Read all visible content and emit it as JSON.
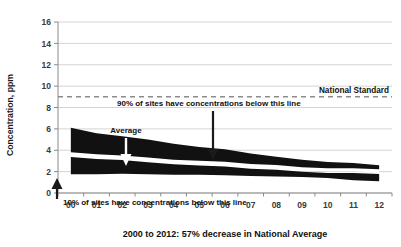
{
  "chart_data": {
    "type": "area",
    "title": "2000 to 2012: 57% decrease in National Average",
    "xlabel": "2000 to 2012: 57% decrease in National Average",
    "ylabel": "Concentration, ppm",
    "ylim": [
      0,
      16
    ],
    "ytick_values": [
      0,
      2,
      4,
      6,
      8,
      10,
      12,
      14,
      16
    ],
    "ytick_labels": [
      "0",
      "2",
      "4",
      "6",
      "8",
      "10",
      "12",
      "14",
      "16"
    ],
    "categories": [
      "00",
      "01",
      "02",
      "03",
      "04",
      "05",
      "06",
      "07",
      "08",
      "09",
      "10",
      "11",
      "12"
    ],
    "x_years": [
      2000,
      2001,
      2002,
      2003,
      2004,
      2005,
      2006,
      2007,
      2008,
      2009,
      2010,
      2011,
      2012
    ],
    "grid": true,
    "legend": "none",
    "series": [
      {
        "name": "90th percentile",
        "values": [
          6.1,
          5.6,
          5.3,
          5.0,
          4.6,
          4.3,
          4.1,
          3.7,
          3.4,
          3.1,
          2.9,
          2.8,
          2.6
        ]
      },
      {
        "name": "Average",
        "values": [
          3.6,
          3.4,
          3.3,
          3.1,
          2.9,
          2.8,
          2.7,
          2.5,
          2.4,
          2.2,
          2.1,
          2.1,
          2.0
        ]
      },
      {
        "name": "10th percentile",
        "values": [
          1.75,
          1.75,
          1.8,
          1.75,
          1.7,
          1.7,
          1.65,
          1.6,
          1.55,
          1.5,
          1.4,
          1.2,
          1.1
        ]
      }
    ],
    "reference_line": {
      "label": "National Standard",
      "value": 9,
      "style": "dashed",
      "color": "#8c8c8c"
    },
    "annotations": [
      {
        "name": "upper-band-note",
        "text": "90% of sites have concentrations below this line",
        "arrow": "down",
        "arrow_color": "#1a1a1a"
      },
      {
        "name": "average-note",
        "text": "Average",
        "arrow": "down",
        "arrow_color": "#ffffff"
      },
      {
        "name": "lower-band-note",
        "text": "10% of sites have concentrations below this line",
        "arrow": "up",
        "arrow_color": "#1a1a1a"
      }
    ],
    "colors": {
      "band": "#111111",
      "average_line": "#ffffff",
      "grid": "#cfcfcf",
      "axis": "#8a8a8a",
      "background": "#ffffff"
    }
  }
}
